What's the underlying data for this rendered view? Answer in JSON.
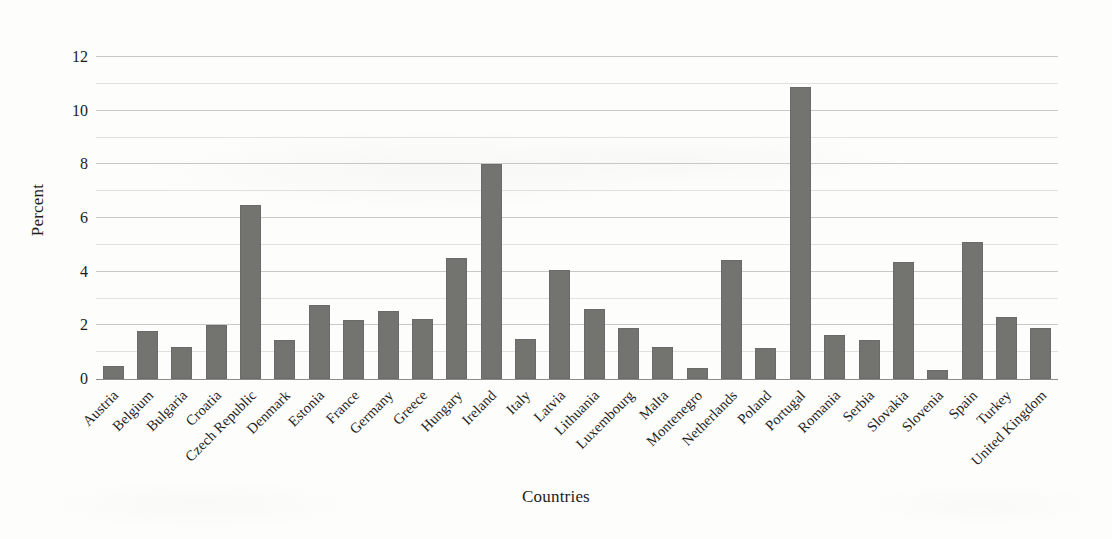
{
  "chart_data": {
    "type": "bar",
    "title": "",
    "xlabel": "Countries",
    "ylabel": "Percent",
    "ylim": [
      0,
      12
    ],
    "yticks": [
      0,
      2,
      4,
      6,
      8,
      10,
      12
    ],
    "minor_gridlines": [
      1,
      3,
      5,
      7,
      9,
      11
    ],
    "grid": true,
    "legend": "none",
    "bar_color": "#737370",
    "categories": [
      "Austria",
      "Belgium",
      "Bulgaria",
      "Croatia",
      "Czech Republic",
      "Denmark",
      "Estonia",
      "France",
      "Germany",
      "Greece",
      "Hungary",
      "Ireland",
      "Italy",
      "Latvia",
      "Lithuania",
      "Luxembourg",
      "Malta",
      "Montenegro",
      "Netherlands",
      "Poland",
      "Portugal",
      "Romania",
      "Serbia",
      "Slovakia",
      "Slovenia",
      "Spain",
      "Turkey",
      "United Kingdom"
    ],
    "values": [
      0.5,
      1.8,
      1.2,
      2.0,
      6.5,
      1.45,
      2.75,
      2.2,
      2.55,
      2.25,
      4.5,
      8.0,
      1.5,
      4.05,
      2.6,
      1.9,
      1.2,
      0.4,
      4.45,
      1.15,
      10.9,
      1.65,
      1.45,
      4.35,
      0.35,
      5.1,
      2.3,
      1.9
    ]
  },
  "axis": {
    "y_title": "Percent",
    "x_title": "Countries"
  }
}
